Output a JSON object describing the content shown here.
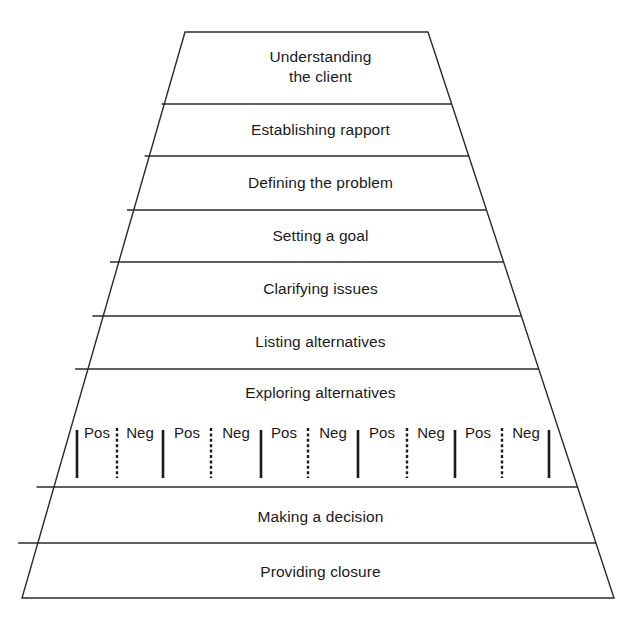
{
  "diagram": {
    "type": "funnel",
    "stages": [
      {
        "label": "Understanding\nthe client"
      },
      {
        "label": "Establishing rapport"
      },
      {
        "label": "Defining the problem"
      },
      {
        "label": "Setting a goal"
      },
      {
        "label": "Clarifying issues"
      },
      {
        "label": "Listing alternatives"
      },
      {
        "label": "Exploring alternatives"
      },
      {
        "label": "Making a decision"
      },
      {
        "label": "Providing closure"
      }
    ],
    "exploring_pairs": [
      {
        "pos": "Pos",
        "neg": "Neg"
      },
      {
        "pos": "Pos",
        "neg": "Neg"
      },
      {
        "pos": "Pos",
        "neg": "Neg"
      },
      {
        "pos": "Pos",
        "neg": "Neg"
      },
      {
        "pos": "Pos",
        "neg": "Neg"
      }
    ]
  },
  "colors": {
    "line": "#2a2a2a",
    "text": "#1a1a1a",
    "background": "#ffffff"
  }
}
